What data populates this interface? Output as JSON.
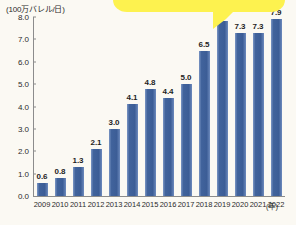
{
  "chart_data": {
    "type": "bar",
    "title": "",
    "ylabel": "(100万バレル/日)",
    "xlabel": "(年)",
    "ylim": [
      0.0,
      8.0
    ],
    "grid": false,
    "legend": "none",
    "ytick_labels": [
      "8.0",
      "7.0",
      "6.0",
      "5.0",
      "4.0",
      "3.0",
      "2.0",
      "1.0",
      "0.0"
    ],
    "ytick_values": [
      8.0,
      7.0,
      6.0,
      5.0,
      4.0,
      3.0,
      2.0,
      1.0,
      0.0
    ],
    "categories": [
      "2009",
      "2010",
      "2011",
      "2012",
      "2013",
      "2014",
      "2015",
      "2016",
      "2017",
      "2018",
      "2019",
      "2020",
      "2021",
      "2022"
    ],
    "values": [
      0.6,
      0.8,
      1.3,
      2.1,
      3.0,
      4.1,
      4.8,
      4.4,
      5.0,
      6.5,
      7.8,
      7.3,
      7.3,
      7.9
    ],
    "value_labels": [
      "0.6",
      "0.8",
      "1.3",
      "2.1",
      "3.0",
      "4.1",
      "4.8",
      "4.4",
      "5.0",
      "6.5",
      "7.8",
      "7.3",
      "7.3",
      "7.9"
    ],
    "bar_color": "#41639c",
    "background_color": "#fbf9f3",
    "axis_color": "#8c8c8c"
  },
  "callout": {
    "shape": "speech-bubble",
    "color": "#fdf24f",
    "text": ""
  }
}
